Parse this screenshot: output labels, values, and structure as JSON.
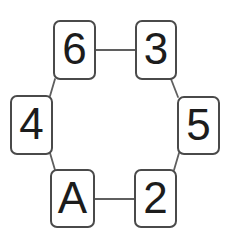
{
  "diagram": {
    "colors": {
      "background": "#ffffff",
      "card_fill": "#ffffff",
      "card_border": "#4a4a4a",
      "connector": "#5f5f5f",
      "text": "#1c1c1c"
    },
    "nodes": [
      {
        "label": "6",
        "position": "top-left"
      },
      {
        "label": "3",
        "position": "top-right"
      },
      {
        "label": "4",
        "position": "middle-left"
      },
      {
        "label": "5",
        "position": "middle-right"
      },
      {
        "label": "A",
        "position": "bottom-left"
      },
      {
        "label": "2",
        "position": "bottom-right"
      }
    ],
    "edges": [
      {
        "from": "6",
        "to": "3"
      },
      {
        "from": "6",
        "to": "4"
      },
      {
        "from": "3",
        "to": "5"
      },
      {
        "from": "4",
        "to": "A"
      },
      {
        "from": "5",
        "to": "2"
      },
      {
        "from": "A",
        "to": "2"
      }
    ]
  }
}
